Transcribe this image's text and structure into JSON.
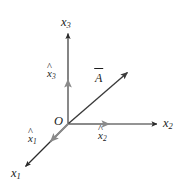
{
  "figure": {
    "type": "diagram",
    "background_color": "#ffffff",
    "axis_color": "#2b2b2b",
    "unit_vector_color": "#8a8a8a",
    "vector_color": "#3a3a3a",
    "text_color": "#1c1c1c",
    "origin": {
      "label": "O",
      "x": 68,
      "y": 124
    },
    "axes": [
      {
        "name": "x1-axis",
        "label_letter": "x",
        "label_subscript": "1",
        "direction": "down-left",
        "from": [
          68,
          124
        ],
        "to": [
          24,
          168
        ],
        "label_x": 12,
        "label_y": 168
      },
      {
        "name": "x2-axis",
        "label_letter": "x",
        "label_subscript": "2",
        "direction": "right",
        "from": [
          68,
          124
        ],
        "to": [
          159,
          124
        ],
        "label_x": 163,
        "label_y": 118
      },
      {
        "name": "x3-axis",
        "label_letter": "x",
        "label_subscript": "3",
        "direction": "up",
        "from": [
          68,
          124
        ],
        "to": [
          68,
          32
        ],
        "label_x": 61,
        "label_y": 16
      }
    ],
    "unit_vectors": [
      {
        "name": "x1-hat",
        "label_letter": "x",
        "label_subscript": "1",
        "accent": "hat",
        "from": [
          68,
          124
        ],
        "to": [
          49,
          143
        ],
        "label_x": 28,
        "label_y": 133
      },
      {
        "name": "x2-hat",
        "label_letter": "x",
        "label_subscript": "2",
        "accent": "hat",
        "from": [
          68,
          124
        ],
        "to": [
          111,
          124
        ],
        "label_x": 98,
        "label_y": 130
      },
      {
        "name": "x3-hat",
        "label_letter": "x",
        "label_subscript": "3",
        "accent": "hat",
        "from": [
          68,
          124
        ],
        "to": [
          68,
          78
        ],
        "label_x": 47,
        "label_y": 68
      }
    ],
    "vector": {
      "name": "vector-A",
      "label_letter": "A",
      "accent": "bar",
      "from": [
        68,
        124
      ],
      "to": [
        129,
        71
      ],
      "label_x": 95,
      "label_y": 72
    }
  }
}
